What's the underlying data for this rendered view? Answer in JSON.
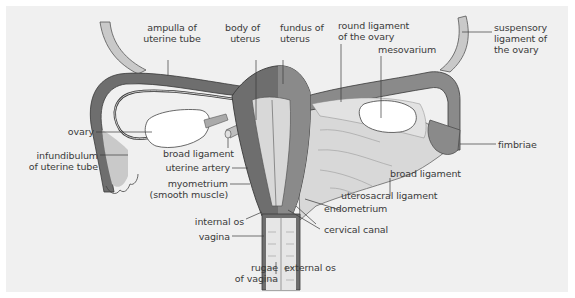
{
  "diagram": {
    "colors": {
      "background": "#f0f0f0",
      "uterus_dark": "#6e6e6e",
      "uterus_mid": "#8a8a8a",
      "ligament_light": "#c9c9c9",
      "cavity_light": "#d8d8d8",
      "ovary": "#ffffff",
      "outline": "#3a3a3a",
      "label_text": "#3a3a3a"
    },
    "labels": {
      "ampulla": [
        "ampulla of",
        "uterine tube"
      ],
      "body_of_uterus": [
        "body of",
        "uterus"
      ],
      "fundus": [
        "fundus of",
        "uterus"
      ],
      "round_ligament": [
        "round ligament",
        "of the ovary"
      ],
      "mesovarium": "mesovarium",
      "suspensory": [
        "suspensory",
        "ligament of",
        "the ovary"
      ],
      "ovary": "ovary",
      "infundibulum": [
        "infundibulum",
        "of uterine tube"
      ],
      "broad_ligament_left": "broad ligament",
      "uterine_artery": "uterine artery",
      "myometrium": [
        "myometrium",
        "(smooth muscle)"
      ],
      "internal_os": "internal os",
      "vagina": "vagina",
      "rugae": [
        "rugae",
        "of vagina"
      ],
      "external_os": "external os",
      "cervical_canal": "cervical canal",
      "endometrium": "endometrium",
      "uterosacral": "uterosacral ligament",
      "broad_ligament_right": "broad ligament",
      "fimbriae": "fimbriae"
    }
  }
}
